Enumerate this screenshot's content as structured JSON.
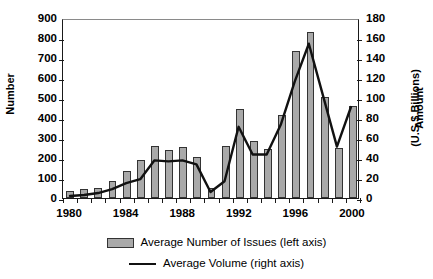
{
  "chart_data": {
    "type": "bar",
    "title": "",
    "subtitle": "",
    "xlabel": "",
    "ylabel": "Number",
    "y2label": "Amount (U.S.$ Billions)",
    "grid": false,
    "legend_position": "bottom",
    "categories": [
      1980,
      1981,
      1982,
      1983,
      1984,
      1985,
      1986,
      1987,
      1988,
      1989,
      1990,
      1991,
      1992,
      1993,
      1994,
      1995,
      1996,
      1997,
      1998,
      1999,
      2000
    ],
    "x_tick_labels": [
      "1980",
      "1984",
      "1988",
      "1992",
      "1996",
      "2000"
    ],
    "x_tick_values": [
      1980,
      1984,
      1988,
      1992,
      1996,
      2000
    ],
    "xlim": [
      1979.5,
      2000.5
    ],
    "ylim": [
      0,
      900
    ],
    "y_ticks": [
      0,
      100,
      200,
      300,
      400,
      500,
      600,
      700,
      800,
      900
    ],
    "y2lim": [
      0,
      180
    ],
    "y2_ticks": [
      0,
      20,
      40,
      60,
      80,
      100,
      120,
      140,
      160,
      180
    ],
    "series": [
      {
        "name": "Average Number of Issues (left axis)",
        "type": "bar",
        "axis": "left",
        "color": "#a9a9a9",
        "values": [
          35,
          45,
          50,
          85,
          135,
          190,
          262,
          240,
          255,
          205,
          50,
          260,
          445,
          285,
          245,
          415,
          735,
          830,
          505,
          250,
          460
        ]
      },
      {
        "name": "Average Volume (right axis)",
        "type": "line",
        "axis": "right",
        "color": "#111111",
        "values": [
          2,
          3,
          5,
          9,
          15,
          19,
          38,
          37,
          38,
          34,
          6,
          17,
          72,
          44,
          44,
          74,
          118,
          156,
          104,
          52,
          92
        ]
      }
    ]
  },
  "axes": {
    "left_title": "Number",
    "right_title_line1": "Amount",
    "right_title_line2": "(U.S.$ Billions)"
  },
  "legend": {
    "items": [
      {
        "label": "Average Number of Issues (left axis)",
        "marker": "bar-swatch-icon"
      },
      {
        "label": "Average Volume (right axis)",
        "marker": "line-swatch-icon"
      }
    ]
  }
}
